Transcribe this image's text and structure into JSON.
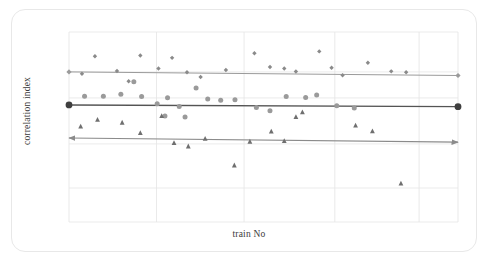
{
  "figure": {
    "background_color": "#ffffff",
    "card_border_color": "#e8e8e8"
  },
  "axes": {
    "xlabel": "train No",
    "ylabel": "correlation index",
    "label_color": "#3b3b3b"
  },
  "chart_data": {
    "type": "scatter",
    "title": "",
    "subtitle": "",
    "xlabel": "train No",
    "ylabel": "correlation index",
    "xlim": [
      0,
      60
    ],
    "ylim": [
      0,
      1
    ],
    "grid": true,
    "x_tick_labels": [],
    "y_tick_labels": [],
    "legend": [],
    "legend_position": "none",
    "x_gridlines": [
      0,
      13.5,
      27,
      41,
      54
    ],
    "y_gridlines": [
      1.0,
      0.79,
      0.653,
      0.411,
      0.179,
      0.0
    ],
    "annotations": [
      "top trend line spans full width with small diamond markers at both ends",
      "middle trend line spans full width with large filled circle markers at both ends",
      "bottom trend line spans full width with arrowheads at both ends"
    ],
    "series": [
      {
        "name": "series-diamond",
        "marker": "diamond",
        "color": "#8a8a8a",
        "marker_size": 4.4,
        "points": [
          {
            "x": 4.0,
            "y": 0.872
          },
          {
            "x": 7.4,
            "y": 0.795
          },
          {
            "x": 11.0,
            "y": 0.876
          },
          {
            "x": 13.8,
            "y": 0.808
          },
          {
            "x": 15.9,
            "y": 0.864
          },
          {
            "x": 18.2,
            "y": 0.788
          },
          {
            "x": 20.3,
            "y": 0.763
          },
          {
            "x": 24.2,
            "y": 0.8
          },
          {
            "x": 28.6,
            "y": 0.888
          },
          {
            "x": 31.0,
            "y": 0.816
          },
          {
            "x": 33.2,
            "y": 0.808
          },
          {
            "x": 35.0,
            "y": 0.792
          },
          {
            "x": 38.6,
            "y": 0.898
          },
          {
            "x": 40.5,
            "y": 0.812
          },
          {
            "x": 42.2,
            "y": 0.772
          },
          {
            "x": 46.1,
            "y": 0.838
          },
          {
            "x": 49.7,
            "y": 0.793
          },
          {
            "x": 52.0,
            "y": 0.788
          },
          {
            "x": 2.0,
            "y": 0.78
          },
          {
            "x": 9.2,
            "y": 0.741
          }
        ]
      },
      {
        "name": "series-circle",
        "marker": "circle",
        "color": "#9a9a9a",
        "marker_size": 5.0,
        "points": [
          {
            "x": 2.4,
            "y": 0.662
          },
          {
            "x": 5.3,
            "y": 0.662
          },
          {
            "x": 8.0,
            "y": 0.672
          },
          {
            "x": 11.2,
            "y": 0.66
          },
          {
            "x": 13.6,
            "y": 0.623
          },
          {
            "x": 15.2,
            "y": 0.654
          },
          {
            "x": 17.0,
            "y": 0.608
          },
          {
            "x": 19.6,
            "y": 0.705
          },
          {
            "x": 21.4,
            "y": 0.648
          },
          {
            "x": 23.4,
            "y": 0.641
          },
          {
            "x": 25.6,
            "y": 0.643
          },
          {
            "x": 28.9,
            "y": 0.603
          },
          {
            "x": 31.0,
            "y": 0.585
          },
          {
            "x": 33.5,
            "y": 0.66
          },
          {
            "x": 36.5,
            "y": 0.655
          },
          {
            "x": 38.2,
            "y": 0.668
          },
          {
            "x": 41.3,
            "y": 0.612
          },
          {
            "x": 44.0,
            "y": 0.6
          },
          {
            "x": 10.0,
            "y": 0.738
          },
          {
            "x": 14.8,
            "y": 0.558
          },
          {
            "x": 17.9,
            "y": 0.553
          }
        ]
      },
      {
        "name": "series-triangle",
        "marker": "triangle",
        "color": "#6f6f6f",
        "marker_size": 4.8,
        "points": [
          {
            "x": 1.8,
            "y": 0.505
          },
          {
            "x": 4.4,
            "y": 0.54
          },
          {
            "x": 8.2,
            "y": 0.525
          },
          {
            "x": 11.0,
            "y": 0.47
          },
          {
            "x": 14.3,
            "y": 0.56
          },
          {
            "x": 16.2,
            "y": 0.418
          },
          {
            "x": 18.4,
            "y": 0.4
          },
          {
            "x": 21.0,
            "y": 0.44
          },
          {
            "x": 25.5,
            "y": 0.3
          },
          {
            "x": 27.9,
            "y": 0.425
          },
          {
            "x": 31.2,
            "y": 0.478
          },
          {
            "x": 33.2,
            "y": 0.428
          },
          {
            "x": 35.0,
            "y": 0.555
          },
          {
            "x": 36.0,
            "y": 0.58
          },
          {
            "x": 44.2,
            "y": 0.51
          },
          {
            "x": 46.8,
            "y": 0.48
          },
          {
            "x": 51.2,
            "y": 0.205
          }
        ]
      }
    ],
    "trend_lines": [
      {
        "name": "trend-top",
        "color": "#9b9b9b",
        "start": {
          "x": 0,
          "y": 0.79
        },
        "end": {
          "x": 60,
          "y": 0.771
        },
        "start_marker": "diamond",
        "end_marker": "diamond",
        "width": 1.0
      },
      {
        "name": "trend-middle",
        "color": "#545454",
        "start": {
          "x": 0,
          "y": 0.616
        },
        "end": {
          "x": 60,
          "y": 0.607
        },
        "start_marker": "circle-large",
        "end_marker": "circle-large",
        "width": 1.4
      },
      {
        "name": "trend-bottom",
        "color": "#8b8b8b",
        "start": {
          "x": 0,
          "y": 0.442
        },
        "end": {
          "x": 60,
          "y": 0.42
        },
        "start_marker": "arrow-left",
        "end_marker": "arrow-right",
        "width": 1.2
      }
    ]
  }
}
